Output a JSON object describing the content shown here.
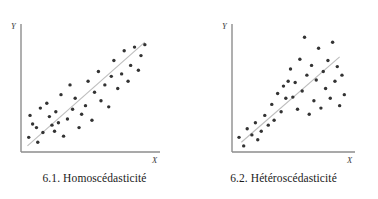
{
  "figure": {
    "panels": [
      {
        "id": "panel-homoscedasticite",
        "caption": "6.1. Homoscédasticité",
        "y_axis_label": "Y",
        "x_axis_label": "X"
      },
      {
        "id": "panel-heteroscedasticite",
        "caption": "6.2. Hétéroscédasticité",
        "y_axis_label": "Y",
        "x_axis_label": "X"
      }
    ]
  },
  "colors": {
    "point": "#333333",
    "axis": "#8d8d8d",
    "trendline": "#bdbdbd",
    "caption_text": "#1a1a1a",
    "background": "#ffffff"
  },
  "chart_data": [
    {
      "type": "scatter",
      "title": "6.1. Homoscédasticité",
      "xlabel": "X",
      "ylabel": "Y",
      "xlim": [
        0,
        100
      ],
      "ylim": [
        0,
        100
      ],
      "grid": false,
      "legend": "none",
      "annotation": "Constant variance of residuals around the regression line (homoscedastic spread)",
      "points": [
        [
          6,
          12
        ],
        [
          7,
          30
        ],
        [
          9,
          23
        ],
        [
          12,
          20
        ],
        [
          13,
          8
        ],
        [
          15,
          36
        ],
        [
          17,
          16
        ],
        [
          20,
          40
        ],
        [
          22,
          29
        ],
        [
          24,
          22
        ],
        [
          26,
          17
        ],
        [
          27,
          33
        ],
        [
          29,
          24
        ],
        [
          31,
          47
        ],
        [
          33,
          13
        ],
        [
          36,
          27
        ],
        [
          38,
          55
        ],
        [
          40,
          35
        ],
        [
          42,
          44
        ],
        [
          45,
          20
        ],
        [
          47,
          31
        ],
        [
          50,
          38
        ],
        [
          52,
          58
        ],
        [
          55,
          26
        ],
        [
          57,
          49
        ],
        [
          60,
          66
        ],
        [
          62,
          42
        ],
        [
          65,
          55
        ],
        [
          68,
          37
        ],
        [
          70,
          62
        ],
        [
          72,
          75
        ],
        [
          75,
          52
        ],
        [
          78,
          64
        ],
        [
          80,
          83
        ],
        [
          83,
          58
        ],
        [
          85,
          71
        ],
        [
          88,
          86
        ],
        [
          91,
          67
        ],
        [
          93,
          79
        ],
        [
          96,
          88
        ]
      ],
      "trendline": {
        "x0": 5,
        "y0": 5,
        "x1": 96,
        "y1": 90
      }
    },
    {
      "type": "scatter",
      "title": "6.2. Hétéroscédasticité",
      "xlabel": "X",
      "ylabel": "Y",
      "xlim": [
        0,
        100
      ],
      "ylim": [
        0,
        100
      ],
      "grid": false,
      "legend": "none",
      "annotation": "Variance of residuals increases with X (fan-shaped heteroscedastic spread)",
      "points": [
        [
          6,
          12
        ],
        [
          10,
          5
        ],
        [
          13,
          19
        ],
        [
          17,
          14
        ],
        [
          20,
          24
        ],
        [
          22,
          10
        ],
        [
          25,
          17
        ],
        [
          28,
          30
        ],
        [
          31,
          22
        ],
        [
          34,
          39
        ],
        [
          36,
          26
        ],
        [
          39,
          48
        ],
        [
          42,
          33
        ],
        [
          44,
          54
        ],
        [
          46,
          44
        ],
        [
          48,
          58
        ],
        [
          50,
          68
        ],
        [
          52,
          45
        ],
        [
          54,
          57
        ],
        [
          56,
          35
        ],
        [
          58,
          76
        ],
        [
          60,
          50
        ],
        [
          62,
          94
        ],
        [
          64,
          63
        ],
        [
          66,
          31
        ],
        [
          68,
          71
        ],
        [
          70,
          42
        ],
        [
          72,
          59
        ],
        [
          74,
          85
        ],
        [
          76,
          36
        ],
        [
          78,
          66
        ],
        [
          80,
          52
        ],
        [
          82,
          75
        ],
        [
          84,
          44
        ],
        [
          86,
          90
        ],
        [
          88,
          58
        ],
        [
          90,
          70
        ],
        [
          92,
          38
        ],
        [
          94,
          63
        ],
        [
          96,
          47
        ]
      ],
      "trendline": {
        "x0": 8,
        "y0": 8,
        "x1": 92,
        "y1": 78
      }
    }
  ]
}
